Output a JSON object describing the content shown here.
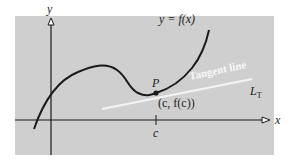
{
  "diagram": {
    "type": "tangent-line-illustration",
    "background_color": "#ffffff",
    "panel_color": "#cfcfcf",
    "curve_color": "#1a1a1a",
    "tangent_color": "#f4f4f4",
    "axis_color": "#1a1a1a",
    "labels": {
      "y_axis": "y",
      "x_axis": "x",
      "function": "y = f(x)",
      "point": "P",
      "point_coords": "(c, f(c))",
      "tick": "c",
      "tangent_text": "Tangent line",
      "tangent_name": "L",
      "tangent_subscript": "T"
    }
  }
}
